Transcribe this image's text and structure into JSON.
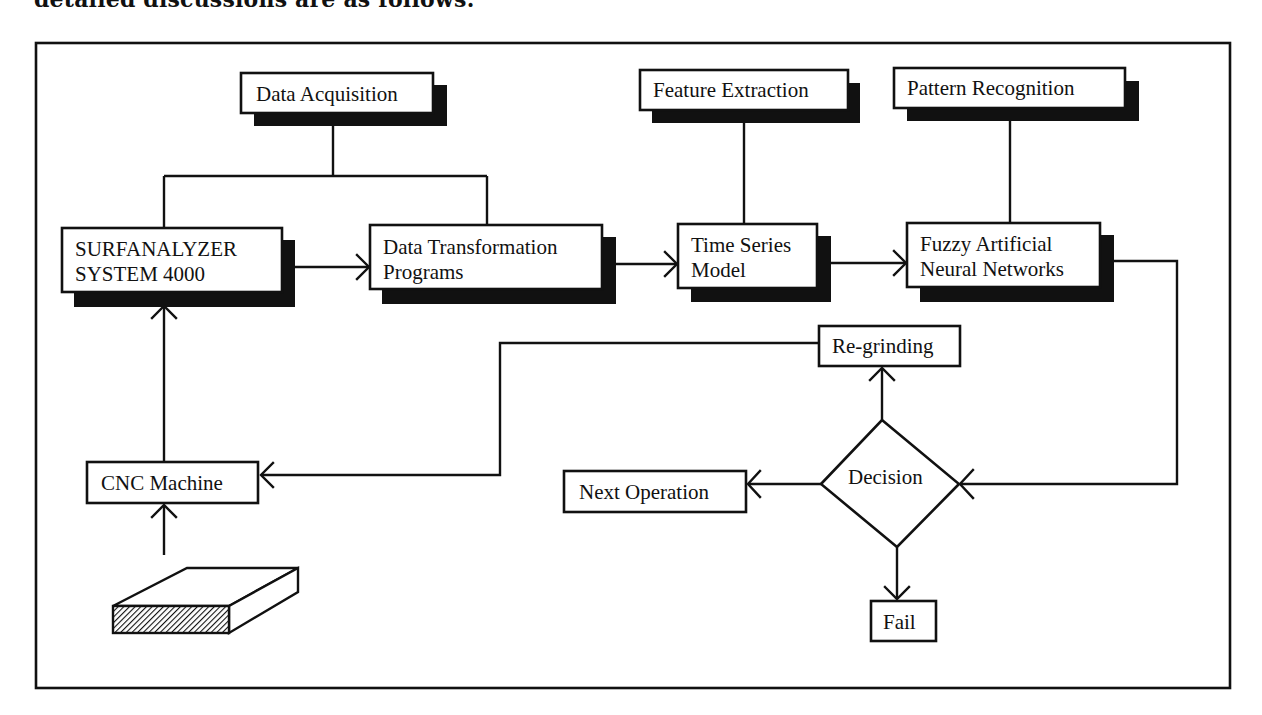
{
  "caption": "detailed discussions are as follows:",
  "diagram": {
    "nodes": {
      "data_acquisition": {
        "label": "Data Acquisition"
      },
      "surfanalyzer": {
        "line1": "SURFANALYZER",
        "line2": "SYSTEM 4000"
      },
      "data_transformation": {
        "line1": "Data Transformation",
        "line2": "Programs"
      },
      "feature_extraction": {
        "label": "Feature Extraction"
      },
      "time_series": {
        "line1": "Time Series",
        "line2": "Model"
      },
      "pattern_recognition": {
        "label": "Pattern Recognition"
      },
      "fuzzy_ann": {
        "line1": "Fuzzy Artificial",
        "line2": "Neural Networks"
      },
      "re_grinding": {
        "label": "Re-grinding"
      },
      "decision": {
        "label": "Decision"
      },
      "next_operation": {
        "label": "Next Operation"
      },
      "fail": {
        "label": "Fail"
      },
      "cnc_machine": {
        "label": "CNC Machine"
      },
      "workpiece": {
        "label": ""
      }
    },
    "edges": [
      {
        "from": "data_acquisition",
        "to": "surfanalyzer",
        "type": "line"
      },
      {
        "from": "data_acquisition",
        "to": "data_transformation",
        "type": "line"
      },
      {
        "from": "surfanalyzer",
        "to": "data_transformation",
        "type": "arrow"
      },
      {
        "from": "data_transformation",
        "to": "time_series",
        "type": "arrow"
      },
      {
        "from": "feature_extraction",
        "to": "time_series",
        "type": "line"
      },
      {
        "from": "time_series",
        "to": "fuzzy_ann",
        "type": "arrow"
      },
      {
        "from": "pattern_recognition",
        "to": "fuzzy_ann",
        "type": "line"
      },
      {
        "from": "fuzzy_ann",
        "to": "decision",
        "type": "arrow"
      },
      {
        "from": "decision",
        "to": "re_grinding",
        "type": "arrow"
      },
      {
        "from": "decision",
        "to": "next_operation",
        "type": "arrow"
      },
      {
        "from": "decision",
        "to": "fail",
        "type": "arrow"
      },
      {
        "from": "re_grinding",
        "to": "cnc_machine",
        "type": "arrow"
      },
      {
        "from": "cnc_machine",
        "to": "surfanalyzer",
        "type": "arrow"
      },
      {
        "from": "workpiece",
        "to": "cnc_machine",
        "type": "arrow"
      }
    ]
  }
}
